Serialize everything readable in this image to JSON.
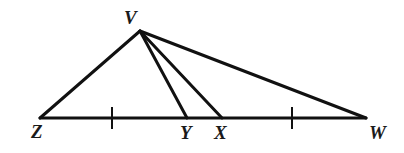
{
  "figure": {
    "name": "triangle-with-cevians",
    "background_color": "#ffffff",
    "stroke_color": "#111111",
    "label_color": "#1a1a1a",
    "canvas": {
      "width": 404,
      "height": 153
    }
  },
  "points": {
    "V": {
      "label": "V",
      "x": 140,
      "y": 31,
      "label_x": 124,
      "label_y": 8
    },
    "Z": {
      "label": "Z",
      "x": 40,
      "y": 118,
      "label_x": 31,
      "label_y": 122
    },
    "Y": {
      "label": "Y",
      "x": 187,
      "y": 118,
      "label_x": 180,
      "label_y": 123
    },
    "X": {
      "label": "X",
      "x": 222,
      "y": 118,
      "label_x": 214,
      "label_y": 123
    },
    "W": {
      "label": "W",
      "x": 366,
      "y": 118,
      "label_x": 369,
      "label_y": 123
    }
  },
  "segments": [
    {
      "name": "side-ZV",
      "from": "Z",
      "to": "V",
      "width": 3
    },
    {
      "name": "side-VW",
      "from": "V",
      "to": "W",
      "width": 3
    },
    {
      "name": "base-ZW",
      "from": "Z",
      "to": "W",
      "width": 3
    },
    {
      "name": "cevian-VY",
      "from": "V",
      "to": "Y",
      "width": 3
    },
    {
      "name": "cevian-VX",
      "from": "V",
      "to": "X",
      "width": 3
    }
  ],
  "tick_marks": [
    {
      "name": "tick-mark-left",
      "x": 112,
      "y_top": 107,
      "y_bottom": 129,
      "width": 2
    },
    {
      "name": "tick-mark-right",
      "x": 292,
      "y_top": 107,
      "y_bottom": 129,
      "width": 2
    }
  ]
}
